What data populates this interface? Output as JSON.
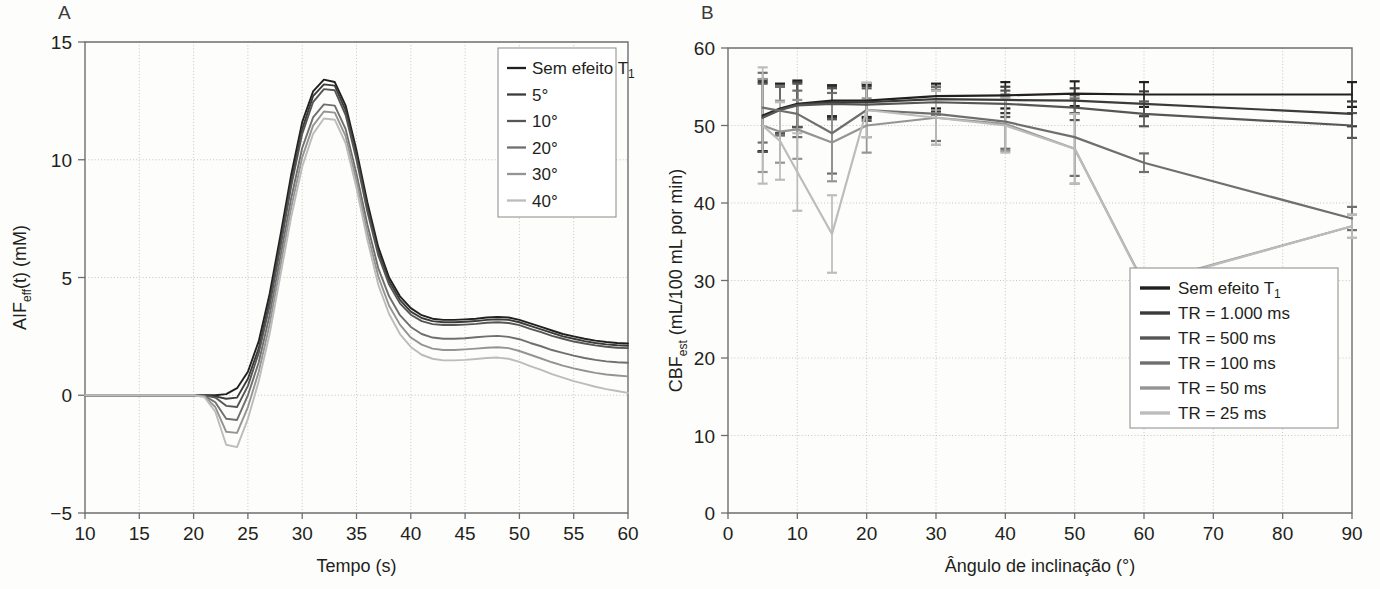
{
  "figure": {
    "panel_a_letter": "A",
    "panel_b_letter": "B"
  },
  "chart_data": [
    {
      "id": "panel-a",
      "type": "line",
      "title": "A",
      "xlabel": "Tempo (s)",
      "ylabel": "AIF",
      "ylabel_sub": "eff",
      "ylabel_rest": "(t) (mM)",
      "ylabel_full": "AIFeff(t) (mM)",
      "xlim": [
        10,
        60
      ],
      "ylim": [
        -5,
        15
      ],
      "xticks": [
        10,
        15,
        20,
        25,
        30,
        35,
        40,
        45,
        50,
        55,
        60
      ],
      "yticks": [
        -5,
        0,
        5,
        10,
        15
      ],
      "xticklabels": [
        "10",
        "15",
        "20",
        "25",
        "30",
        "35",
        "40",
        "45",
        "50",
        "55",
        "60"
      ],
      "yticklabels": [
        "−5",
        "0",
        "5",
        "10",
        "15"
      ],
      "grid": true,
      "legend_position": "top-right",
      "legend": [
        {
          "label": "Sem efeito T",
          "sub": "1",
          "color": "#231f20"
        },
        {
          "label": "5°",
          "sub": "",
          "color": "#3b3b3b"
        },
        {
          "label": "10°",
          "sub": "",
          "color": "#565656"
        },
        {
          "label": "20°",
          "sub": "",
          "color": "#6f6f6f"
        },
        {
          "label": "30°",
          "sub": "",
          "color": "#949494"
        },
        {
          "label": "40°",
          "sub": "",
          "color": "#bcbcbc"
        }
      ],
      "x": [
        10,
        12,
        14,
        16,
        18,
        20,
        21,
        22,
        23,
        24,
        25,
        26,
        27,
        28,
        29,
        30,
        31,
        32,
        33,
        34,
        35,
        36,
        37,
        38,
        39,
        40,
        41,
        42,
        43,
        44,
        45,
        46,
        47,
        48,
        49,
        50,
        51,
        52,
        53,
        54,
        55,
        56,
        57,
        58,
        59,
        60
      ],
      "series": [
        {
          "name": "Sem efeito T1",
          "color": "#231f20",
          "values": [
            0,
            0,
            0,
            0,
            0,
            0,
            0,
            0,
            0.05,
            0.3,
            1.0,
            2.3,
            4.3,
            6.8,
            9.4,
            11.6,
            12.9,
            13.4,
            13.3,
            12.3,
            10.4,
            8.2,
            6.3,
            5.0,
            4.2,
            3.7,
            3.4,
            3.25,
            3.2,
            3.2,
            3.22,
            3.25,
            3.3,
            3.32,
            3.3,
            3.2,
            3.05,
            2.9,
            2.75,
            2.6,
            2.5,
            2.4,
            2.32,
            2.26,
            2.22,
            2.2
          ]
        },
        {
          "name": "5°",
          "color": "#3b3b3b",
          "values": [
            0,
            0,
            0,
            0,
            0,
            0,
            0,
            -0.05,
            -0.15,
            -0.1,
            0.7,
            2.0,
            4.0,
            6.5,
            9.1,
            11.3,
            12.7,
            13.2,
            13.15,
            12.1,
            10.2,
            8.0,
            6.1,
            4.85,
            4.05,
            3.55,
            3.28,
            3.15,
            3.1,
            3.1,
            3.12,
            3.15,
            3.2,
            3.22,
            3.2,
            3.1,
            2.95,
            2.8,
            2.65,
            2.5,
            2.4,
            2.3,
            2.22,
            2.16,
            2.12,
            2.1
          ]
        },
        {
          "name": "10°",
          "color": "#565656",
          "values": [
            0,
            0,
            0,
            0,
            0,
            0,
            0,
            -0.1,
            -0.45,
            -0.5,
            0.4,
            1.8,
            3.8,
            6.3,
            8.9,
            11.1,
            12.45,
            13.0,
            12.95,
            11.9,
            10.0,
            7.8,
            5.95,
            4.7,
            3.9,
            3.42,
            3.15,
            3.02,
            2.98,
            2.98,
            3.0,
            3.03,
            3.08,
            3.1,
            3.07,
            2.98,
            2.82,
            2.68,
            2.52,
            2.4,
            2.28,
            2.2,
            2.12,
            2.06,
            2.02,
            2.0
          ]
        },
        {
          "name": "20°",
          "color": "#6f6f6f",
          "values": [
            0,
            0,
            0,
            0,
            0,
            0,
            -0.02,
            -0.3,
            -1.0,
            -1.05,
            0.0,
            1.4,
            3.4,
            5.9,
            8.4,
            10.5,
            11.8,
            12.35,
            12.3,
            11.3,
            9.4,
            7.25,
            5.4,
            4.2,
            3.4,
            2.9,
            2.6,
            2.45,
            2.4,
            2.4,
            2.42,
            2.46,
            2.5,
            2.52,
            2.48,
            2.38,
            2.22,
            2.08,
            1.92,
            1.8,
            1.68,
            1.58,
            1.5,
            1.44,
            1.4,
            1.38
          ]
        },
        {
          "name": "30°",
          "color": "#949494",
          "values": [
            0,
            0,
            0,
            0,
            0,
            0,
            -0.05,
            -0.5,
            -1.55,
            -1.6,
            -0.5,
            1.0,
            3.0,
            5.5,
            8.0,
            10.1,
            11.45,
            12.05,
            12.0,
            11.0,
            9.1,
            6.9,
            5.05,
            3.8,
            3.0,
            2.45,
            2.15,
            1.98,
            1.92,
            1.92,
            1.95,
            1.98,
            2.02,
            2.04,
            2.0,
            1.88,
            1.72,
            1.56,
            1.4,
            1.26,
            1.14,
            1.04,
            0.95,
            0.88,
            0.84,
            0.8
          ]
        },
        {
          "name": "40°",
          "color": "#bcbcbc",
          "values": [
            0,
            0,
            0,
            0,
            0,
            0,
            -0.08,
            -0.7,
            -2.1,
            -2.2,
            -1.0,
            0.6,
            2.6,
            5.1,
            7.6,
            9.7,
            11.1,
            11.75,
            11.7,
            10.7,
            8.8,
            6.6,
            4.7,
            3.45,
            2.6,
            2.05,
            1.72,
            1.55,
            1.48,
            1.48,
            1.5,
            1.54,
            1.58,
            1.6,
            1.55,
            1.42,
            1.24,
            1.08,
            0.9,
            0.75,
            0.6,
            0.48,
            0.36,
            0.26,
            0.18,
            0.1
          ]
        }
      ]
    },
    {
      "id": "panel-b",
      "type": "line",
      "title": "B",
      "xlabel": "Ângulo de inclinação (°)",
      "ylabel": "CBF",
      "ylabel_sub": "est",
      "ylabel_rest": "(mL/100 mL por min)",
      "ylabel_full": "CBFest (mL/100 mL por min)",
      "xlim": [
        0,
        90
      ],
      "ylim": [
        0,
        60
      ],
      "xticks": [
        0,
        10,
        20,
        30,
        40,
        50,
        60,
        70,
        80,
        90
      ],
      "yticks": [
        0,
        10,
        20,
        30,
        40,
        50,
        60
      ],
      "xticklabels": [
        "0",
        "10",
        "20",
        "30",
        "40",
        "50",
        "60",
        "70",
        "80",
        "90"
      ],
      "yticklabels": [
        "0",
        "10",
        "20",
        "30",
        "40",
        "50",
        "60"
      ],
      "grid": true,
      "errorbars": true,
      "legend_position": "bottom-right",
      "legend": [
        {
          "label": "Sem efeito T",
          "sub": "1",
          "color": "#231f20"
        },
        {
          "label": "TR  = 1.000 ms",
          "sub": "",
          "color": "#3b3b3b"
        },
        {
          "label": "TR  = 500 ms",
          "sub": "",
          "color": "#565656"
        },
        {
          "label": "TR  = 100 ms",
          "sub": "",
          "color": "#6f6f6f"
        },
        {
          "label": "TR  = 50 ms",
          "sub": "",
          "color": "#949494"
        },
        {
          "label": "TR  = 25 ms",
          "sub": "",
          "color": "#bcbcbc"
        }
      ],
      "x": [
        5,
        7.5,
        10,
        15,
        20,
        30,
        40,
        50,
        60,
        90
      ],
      "series": [
        {
          "name": "Sem efeito T1",
          "color": "#231f20",
          "values": [
            51.3,
            52.2,
            52.8,
            53.2,
            53.2,
            53.8,
            53.9,
            54.1,
            54.0,
            54.0
          ],
          "err_up": [
            4.6,
            3.2,
            3.0,
            2.0,
            2.1,
            1.6,
            1.7,
            1.6,
            1.6,
            1.6
          ],
          "err_dn": [
            4.6,
            3.2,
            3.0,
            2.0,
            2.1,
            1.6,
            1.7,
            1.6,
            1.6,
            1.6
          ]
        },
        {
          "name": "TR = 1.000 ms",
          "color": "#3b3b3b",
          "values": [
            51.1,
            52.1,
            52.7,
            53.0,
            53.0,
            53.4,
            53.3,
            53.2,
            52.8,
            51.5
          ],
          "err_up": [
            4.5,
            3.1,
            2.9,
            2.0,
            2.1,
            1.6,
            1.7,
            1.6,
            1.6,
            1.6
          ],
          "err_dn": [
            4.5,
            3.1,
            2.9,
            2.0,
            2.1,
            1.6,
            1.7,
            1.6,
            1.6,
            1.6
          ]
        },
        {
          "name": "TR = 500 ms",
          "color": "#565656",
          "values": [
            51.0,
            52.0,
            52.6,
            52.8,
            52.7,
            53.0,
            52.8,
            52.3,
            51.5,
            50.0
          ],
          "err_up": [
            4.4,
            3.0,
            2.8,
            2.0,
            2.1,
            1.6,
            1.7,
            1.6,
            1.6,
            1.6
          ],
          "err_dn": [
            4.4,
            3.0,
            2.8,
            2.0,
            2.1,
            1.6,
            1.7,
            1.6,
            1.6,
            1.6
          ]
        },
        {
          "name": "TR = 100 ms",
          "color": "#6f6f6f",
          "values": [
            52.3,
            51.9,
            51.5,
            49.0,
            52.0,
            51.5,
            50.5,
            48.5,
            45.2,
            38.0
          ],
          "err_up": [
            4.5,
            3.2,
            3.0,
            5.2,
            3.5,
            3.5,
            3.5,
            5.0,
            1.2,
            1.5
          ],
          "err_dn": [
            4.5,
            3.2,
            3.0,
            5.2,
            3.5,
            3.5,
            3.5,
            5.0,
            1.2,
            1.5
          ]
        },
        {
          "name": "TR = 50 ms",
          "color": "#949494",
          "values": [
            50.0,
            49.2,
            49.5,
            47.8,
            50.0,
            51.0,
            50.2,
            47.0,
            29.6,
            37.0
          ],
          "err_up": [
            6.0,
            4.0,
            3.8,
            5.0,
            3.5,
            3.5,
            3.5,
            4.5,
            1.3,
            1.5
          ],
          "err_dn": [
            6.0,
            4.0,
            3.8,
            5.0,
            3.5,
            3.5,
            3.5,
            4.5,
            1.3,
            1.5
          ]
        },
        {
          "name": "TR = 25 ms",
          "color": "#bcbcbc",
          "values": [
            50.0,
            48.0,
            44.0,
            36.0,
            52.0,
            51.0,
            50.0,
            47.0,
            29.5,
            37.0
          ],
          "err_up": [
            7.5,
            5.0,
            5.0,
            5.0,
            3.5,
            3.5,
            3.5,
            4.5,
            1.3,
            1.5
          ],
          "err_dn": [
            7.5,
            5.0,
            5.0,
            5.0,
            3.5,
            3.5,
            3.5,
            4.5,
            1.3,
            1.5
          ]
        }
      ]
    }
  ]
}
